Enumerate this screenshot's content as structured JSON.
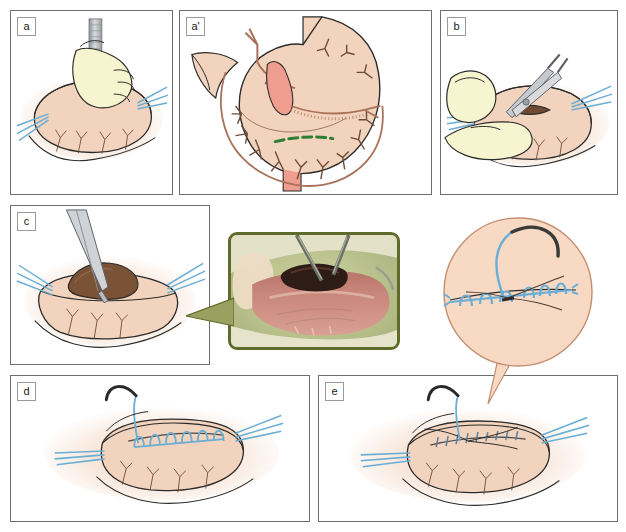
{
  "figure": {
    "type": "surgical-technique-illustration",
    "background_color": "#ffffff",
    "panel_count": 6,
    "colors": {
      "tissue": "#f2d3bd",
      "tissue_shadow": "#e8c0a6",
      "glove": "#f7f4d0",
      "suture_blue": "#6aaed6",
      "incision_green": "#2e7d32",
      "instrument_steel": "#b9bcc0",
      "mucosa_dark": "#7a5236",
      "outline": "#2b2b2b",
      "panel_border": "#6e6e6e",
      "photo_border": "#5f6b2a",
      "drape_green": "#b9c08a"
    }
  },
  "panels": [
    {
      "id": "a",
      "label": "a",
      "caption_visible": false,
      "description": "Gloved hand holding a scalpel making a small incision in the seromuscular layer of the stomach wall; blue retraction sutures on both sides",
      "geometry": {
        "left": 10,
        "top": 10,
        "width": 163,
        "height": 185
      }
    },
    {
      "id": "a-prime",
      "label": "a'",
      "caption_visible": false,
      "description": "Anatomical diagram of the stomach with arterial supply (left and right gastric, gastroepiploic arcades) and a green dashed line marking the planned incision site on the anterior gastric wall",
      "geometry": {
        "left": 179,
        "top": 10,
        "width": 253,
        "height": 185
      }
    },
    {
      "id": "b",
      "label": "b",
      "caption_visible": false,
      "description": "Gloved fingers stabilising the stomach wall while fine scissors extend the seromuscular incision",
      "geometry": {
        "left": 440,
        "top": 10,
        "width": 178,
        "height": 185
      }
    },
    {
      "id": "c",
      "label": "c",
      "caption_visible": false,
      "description": "Incision opened to expose the dark submucosa/mucosa bulging through the seromuscular defect, instrument retracting the edge",
      "geometry": {
        "left": 10,
        "top": 205,
        "width": 200,
        "height": 160
      }
    },
    {
      "id": "d",
      "label": "d",
      "caption_visible": false,
      "description": "Running blue suture line placed across the closed incision with curved needle still attached",
      "geometry": {
        "left": 10,
        "top": 375,
        "width": 300,
        "height": 147
      }
    },
    {
      "id": "e",
      "label": "e",
      "caption_visible": false,
      "description": "Final tightened and approximated suture line completing the closure of the gastric wall",
      "geometry": {
        "left": 318,
        "top": 375,
        "width": 300,
        "height": 147
      }
    }
  ],
  "photo_inset": {
    "name": "intraoperative-photograph",
    "description": "Intraoperative close-up photograph of the opened gastric wall with dark exposed mucosa and metal instruments, surrounded by pale green surgical drapes",
    "border_color": "#5f6b2a",
    "points_to_panel": "c",
    "geometry": {
      "left": 228,
      "top": 232,
      "width": 172,
      "height": 118
    }
  },
  "callout_bubble": {
    "name": "suture-detail-callout",
    "description": "Circular magnified view of the running suture line showing individual blue stitches and the curved needle entering the tissue",
    "points_to_panel": "e",
    "fill_color": "#f7d9c4",
    "geometry": {
      "left": 442,
      "top": 218,
      "diameter": 160
    }
  }
}
